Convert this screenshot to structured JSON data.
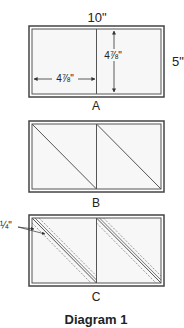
{
  "diagram": {
    "title": "Diagram 1",
    "colors": {
      "line": "#444444",
      "fill": "#f7f7f7",
      "border_gap": "#ffffff"
    },
    "panels": [
      {
        "id": "A",
        "label": "A",
        "top_dimension": "10\"",
        "side_dimension": "5\"",
        "inner_width_label": "4⅞\"",
        "inner_height_label": "4⅞\""
      },
      {
        "id": "B",
        "label": "B"
      },
      {
        "id": "C",
        "label": "C",
        "seam_allowance_label": "¼\""
      }
    ]
  }
}
